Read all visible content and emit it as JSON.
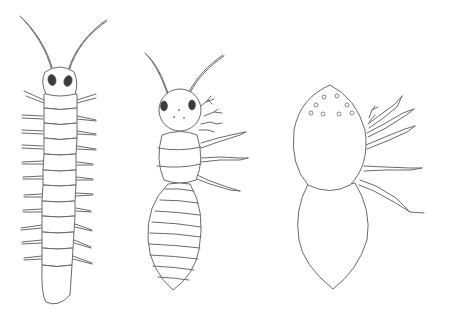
{
  "figure": {
    "description": "Line drawing of three arthropod-like creatures shown in dorsal view, side by side",
    "background_color": "#ffffff",
    "line_color": "#6a6a6a",
    "eye_color": "#3c3c3c"
  },
  "specimens": [
    {
      "id": "left",
      "label": "elongated segmented body",
      "features": [
        "two long antennae",
        "round head with two dark eyes",
        "many body segments",
        "paired short spiny legs along both sides",
        "rounded tail segment"
      ],
      "segment_count": 11,
      "leg_pairs": 11
    },
    {
      "id": "middle",
      "label": "ant-like body",
      "features": [
        "two long antennae",
        "round head with two dark eyes and small dots",
        "small feathery appendages on right of head",
        "banded thorax",
        "striped oval abdomen",
        "legs drawn on right side only"
      ],
      "abdomen_stripes": 10,
      "legs_drawn": 3
    },
    {
      "id": "right",
      "label": "spider-like body",
      "features": [
        "egg-shaped cephalothorax with small ring-shaped eyes",
        "large oval abdomen",
        "clawed pedipalp and legs drawn on right side only"
      ],
      "ocelli_count": 10,
      "legs_drawn": 5
    }
  ]
}
